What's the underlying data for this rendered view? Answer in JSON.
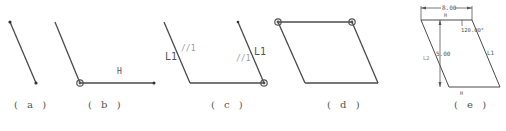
{
  "colors": {
    "line": "#4a4a4a",
    "label": "#5a5a5a",
    "faint_label": "#9a9a9a",
    "background": "#ffffff"
  },
  "panels": [
    {
      "id": "a",
      "caption": "( a )"
    },
    {
      "id": "b",
      "caption": "( b )",
      "labels": {
        "horizontal": "H"
      }
    },
    {
      "id": "c",
      "caption": "( c )",
      "labels": {
        "left_length": "L1",
        "left_parallel": "//1",
        "right_length": "L1",
        "right_parallel": "//1"
      }
    },
    {
      "id": "d",
      "caption": "( d )"
    },
    {
      "id": "e",
      "caption": "( e )",
      "labels": {
        "top_dimension": "8.00",
        "top_edge": "H",
        "angle": "120.00°",
        "height": "5.00",
        "left_edge": "L2",
        "right_edge": "L1",
        "bottom_edge": "H"
      }
    }
  ]
}
